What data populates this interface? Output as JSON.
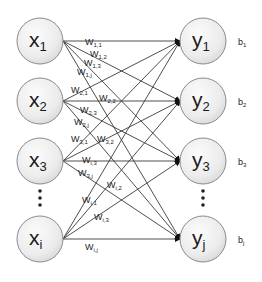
{
  "diagram": {
    "type": "fully-connected-layer",
    "input_nodes": [
      {
        "id": "x1",
        "base": "x",
        "sub": "1",
        "cx": 40,
        "cy": 41
      },
      {
        "id": "x2",
        "base": "x",
        "sub": "2",
        "cx": 40,
        "cy": 101
      },
      {
        "id": "x3",
        "base": "x",
        "sub": "3",
        "cx": 40,
        "cy": 161
      },
      {
        "id": "xi",
        "base": "x",
        "sub": "i",
        "cx": 40,
        "cy": 239
      }
    ],
    "output_nodes": [
      {
        "id": "y1",
        "base": "y",
        "sub": "1",
        "cx": 203,
        "cy": 41,
        "bias": {
          "base": "b",
          "sub": "1"
        }
      },
      {
        "id": "y2",
        "base": "y",
        "sub": "2",
        "cx": 203,
        "cy": 101,
        "bias": {
          "base": "b",
          "sub": "2"
        }
      },
      {
        "id": "y3",
        "base": "y",
        "sub": "3",
        "cx": 203,
        "cy": 161,
        "bias": {
          "base": "b",
          "sub": "3"
        }
      },
      {
        "id": "yj",
        "base": "y",
        "sub": "j",
        "cx": 203,
        "cy": 239,
        "bias": {
          "base": "b",
          "sub": "j"
        }
      }
    ],
    "ellipsis": "⋮",
    "weights": [
      {
        "label": "W",
        "sub": "1,1",
        "x": 85,
        "y": 45
      },
      {
        "label": "W",
        "sub": "1,2",
        "x": 90,
        "y": 57
      },
      {
        "label": "W",
        "sub": "1,3",
        "x": 84,
        "y": 66
      },
      {
        "label": "W",
        "sub": "1,j",
        "x": 77,
        "y": 75
      },
      {
        "label": "W",
        "sub": "2,1",
        "x": 71,
        "y": 93
      },
      {
        "label": "W",
        "sub": "2,2",
        "x": 99,
        "y": 101
      },
      {
        "label": "W",
        "sub": "2,3",
        "x": 80,
        "y": 113
      },
      {
        "label": "W",
        "sub": "2,j",
        "x": 74,
        "y": 125
      },
      {
        "label": "W",
        "sub": "3,1",
        "x": 71,
        "y": 142
      },
      {
        "label": "W",
        "sub": "3,2",
        "x": 97,
        "y": 142
      },
      {
        "label": "W",
        "sub": "i,3",
        "x": 82,
        "y": 163
      },
      {
        "label": "W",
        "sub": "3,j",
        "x": 78,
        "y": 176
      },
      {
        "label": "W",
        "sub": "i,2",
        "x": 107,
        "y": 188
      },
      {
        "label": "W",
        "sub": "i,1",
        "x": 82,
        "y": 203
      },
      {
        "label": "W",
        "sub": "i,3",
        "x": 94,
        "y": 220
      },
      {
        "label": "W",
        "sub": "i,j",
        "x": 85,
        "y": 250
      }
    ]
  }
}
